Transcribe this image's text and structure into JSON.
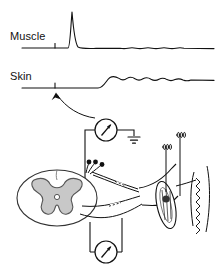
{
  "figure": {
    "type": "physiology-schematic"
  },
  "traces": {
    "muscle": {
      "label": "Muscle",
      "stimulus_marker": "tick",
      "waveform": "sharp-spike",
      "baseline_y": 48,
      "peak_y": 12,
      "peak_x": 72,
      "tick_x": 55,
      "ripple": "small-tail-ripple"
    },
    "skin": {
      "label": "Skin",
      "stimulus_marker": "tick",
      "waveform": "step-with-damped-oscillation",
      "baseline_y": 88,
      "step_y": 76,
      "step_x": 110,
      "tick_x": 55,
      "ripple": "damped-oscillation"
    }
  },
  "diagram": {
    "spinal_cord": {
      "name": "spinal-cord-cross-section",
      "gray_matter": "butterfly-gray-matter",
      "central_canal": "central-canal"
    },
    "synapse": {
      "name": "synaptic-boutons",
      "bouton_count": 3
    },
    "fibers": {
      "afferent": "sensory-afferent-fiber",
      "efferent": "motor-efferent-fiber",
      "break_marks": "dashed-interruption"
    },
    "muscle_spindle": {
      "name": "muscle-spindle",
      "shape": "ellipse-with-intrafusal-fibers"
    },
    "tendon": {
      "name": "tendon",
      "shape": "zigzag"
    },
    "spindle_endings": {
      "name": "coiled-nerve-endings",
      "count": 2
    },
    "meters": {
      "upper": {
        "name": "upper-meter",
        "needle_direction": "up-right",
        "ground": "earth-ground-symbol"
      },
      "lower": {
        "name": "lower-meter",
        "needle_direction": "up-right"
      }
    },
    "pointer_arrow": {
      "name": "stimulus-pointer-arrow",
      "from": "upper-meter",
      "to": "skin-trace-stimulus-tick"
    }
  },
  "colors": {
    "ink": "#111111",
    "gray_matter_fill": "#c8c8c8",
    "gray_matter_stroke": "#555555",
    "background": "#ffffff"
  }
}
